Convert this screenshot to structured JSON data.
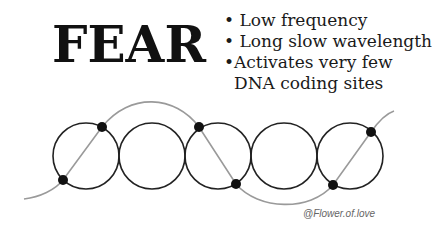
{
  "title": "FEAR",
  "bullets": [
    {
      "marker": "•",
      "text": " Low frequency"
    },
    {
      "marker": "•",
      "text": " Long slow wavelength"
    },
    {
      "marker": "•",
      "text": "Activates very few"
    }
  ],
  "bullet_continuation": "DNA coding sites",
  "credit": "@Flower.of.love",
  "diagram": {
    "circle_count": 5,
    "colors": {
      "circle": "#222222",
      "wave": "#999999",
      "dot": "#111111"
    },
    "dots": 6
  }
}
